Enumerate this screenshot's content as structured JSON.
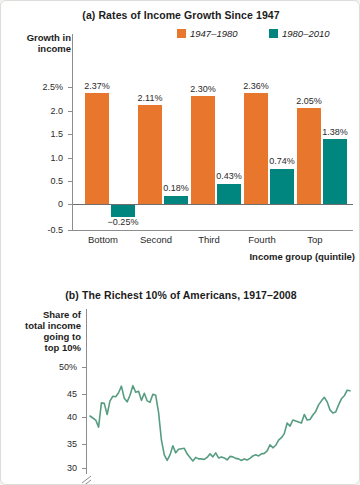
{
  "figure": {
    "background": "#ffffff",
    "colors": {
      "period1": "#e8762c",
      "period2": "#00857f",
      "line": "#569c80",
      "axis": "#8d8d8d"
    }
  },
  "chart_data": [
    {
      "type": "bar",
      "panel": "(a)",
      "title": "(a) Rates of Income Growth Since 1947",
      "xlabel": "Income group (quintile)",
      "ylabel": "Growth in income",
      "categories": [
        "Bottom",
        "Second",
        "Third",
        "Fourth",
        "Top"
      ],
      "ytick_labels": [
        "2.5%",
        "2.0",
        "1.5",
        "1.0",
        "0.5",
        "0",
        "-0.5"
      ],
      "ytick_values": [
        2.5,
        2.0,
        1.5,
        1.0,
        0.5,
        0,
        -0.5
      ],
      "ylim": [
        -0.5,
        2.75
      ],
      "grid": false,
      "legend_position": "top-right",
      "series": [
        {
          "name": "1947–1980",
          "color": "#e8762c",
          "values": [
            2.37,
            2.11,
            2.3,
            2.36,
            2.05
          ],
          "labels": [
            "2.37%",
            "2.11%",
            "2.30%",
            "2.36%",
            "2.05%"
          ]
        },
        {
          "name": "1980–2010",
          "color": "#00857f",
          "values": [
            -0.25,
            0.18,
            0.43,
            0.74,
            1.38
          ],
          "labels": [
            "−0.25%",
            "0.18%",
            "0.43%",
            "0.74%",
            "1.38%"
          ]
        }
      ]
    },
    {
      "type": "line",
      "panel": "(b)",
      "title": "(b) The Richest 10% of Americans, 1917–2008",
      "xlabel": "",
      "ylabel": "Share of total income going to top 10%",
      "ylabel_lines": [
        "Share of",
        "total income",
        "going to",
        "top 10%"
      ],
      "ytick_labels": [
        "50%",
        "45",
        "40",
        "35",
        "30"
      ],
      "ytick_values": [
        50,
        45,
        40,
        35,
        30
      ],
      "ylim": [
        28,
        52
      ],
      "axis_break": true,
      "grid": false,
      "legend_position": "none",
      "series": [
        {
          "name": "Share of total income going to top 10%",
          "color": "#569c80",
          "x": [
            1917,
            1918,
            1919,
            1920,
            1921,
            1922,
            1923,
            1924,
            1925,
            1926,
            1927,
            1928,
            1929,
            1930,
            1931,
            1932,
            1933,
            1934,
            1935,
            1936,
            1937,
            1938,
            1939,
            1940,
            1941,
            1942,
            1943,
            1944,
            1945,
            1946,
            1947,
            1948,
            1949,
            1950,
            1951,
            1952,
            1953,
            1954,
            1955,
            1956,
            1957,
            1958,
            1959,
            1960,
            1961,
            1962,
            1963,
            1964,
            1965,
            1966,
            1967,
            1968,
            1969,
            1970,
            1971,
            1972,
            1973,
            1974,
            1975,
            1976,
            1977,
            1978,
            1979,
            1980,
            1981,
            1982,
            1983,
            1984,
            1985,
            1986,
            1987,
            1988,
            1989,
            1990,
            1991,
            1992,
            1993,
            1994,
            1995,
            1996,
            1997,
            1998,
            1999,
            2000,
            2001,
            2002,
            2003,
            2004,
            2005,
            2006,
            2007,
            2008
          ],
          "values": [
            40.3,
            39.9,
            39.5,
            38.1,
            42.9,
            42.8,
            40.6,
            43.3,
            44.2,
            44.1,
            44.9,
            46.2,
            43.8,
            43.1,
            44.4,
            46.3,
            45.0,
            45.2,
            43.4,
            44.8,
            43.3,
            43.0,
            44.6,
            44.4,
            41.0,
            35.5,
            32.6,
            31.5,
            32.6,
            34.4,
            33.0,
            33.7,
            33.8,
            33.9,
            32.8,
            32.1,
            31.4,
            32.1,
            31.8,
            31.8,
            31.7,
            32.1,
            32.8,
            32.2,
            33.0,
            32.0,
            32.2,
            32.0,
            31.6,
            32.3,
            32.2,
            31.9,
            31.8,
            31.5,
            31.8,
            31.6,
            31.9,
            32.4,
            32.6,
            32.4,
            32.8,
            32.9,
            33.4,
            34.6,
            34.0,
            34.5,
            35.5,
            36.0,
            36.8,
            38.9,
            38.3,
            39.5,
            39.3,
            39.1,
            38.9,
            40.6,
            39.5,
            39.6,
            40.5,
            41.2,
            42.5,
            43.3,
            44.0,
            43.1,
            41.5,
            40.9,
            41.1,
            42.5,
            43.7,
            44.3,
            45.4,
            45.3
          ]
        }
      ]
    }
  ]
}
